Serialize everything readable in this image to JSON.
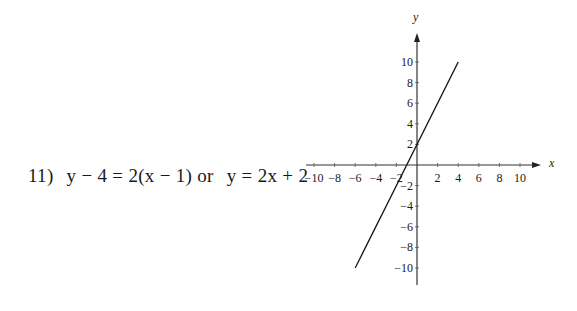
{
  "problem": {
    "number": "11)",
    "point_slope": "y − 4  =  2(x − 1)",
    "connector": "or",
    "slope_intercept": "y  =  2x + 2"
  },
  "chart_data": {
    "type": "line",
    "title": "",
    "xlabel": "x",
    "ylabel": "y",
    "xlim": [
      -10,
      10
    ],
    "ylim": [
      -10,
      10
    ],
    "x_ticks": [
      -10,
      -8,
      -6,
      -4,
      -2,
      2,
      4,
      6,
      8,
      10
    ],
    "y_ticks": [
      10,
      8,
      6,
      4,
      2,
      -2,
      -4,
      -6,
      -8,
      -10
    ],
    "x_tick_labels": [
      "−10",
      "−8",
      "−6",
      "−4",
      "−2",
      "2",
      "4",
      "6",
      "8",
      "10"
    ],
    "y_tick_labels": [
      "10",
      "8",
      "6",
      "4",
      "2",
      "−2",
      "−4",
      "−6",
      "−8",
      "−10"
    ],
    "grid": false,
    "series": [
      {
        "name": "y = 2x + 2",
        "x": [
          -6,
          4
        ],
        "y": [
          -10,
          10
        ]
      }
    ]
  }
}
